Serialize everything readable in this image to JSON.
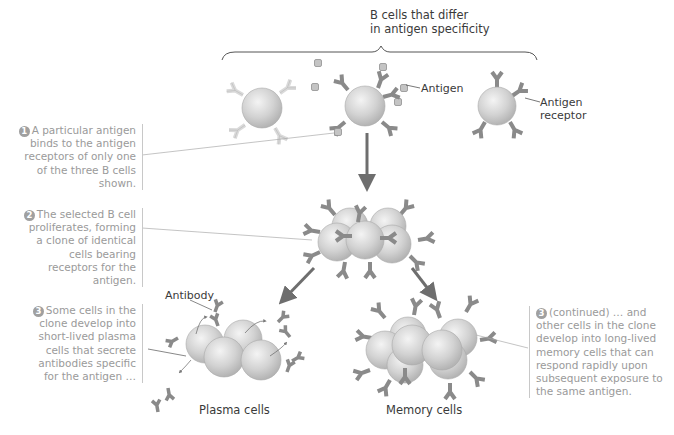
{
  "title": {
    "line1": "B cells that differ",
    "line2": "in antigen specificity"
  },
  "labels": {
    "antigen": "Antigen",
    "antigen_receptor_line1": "Antigen",
    "antigen_receptor_line2": "receptor",
    "antibody": "Antibody",
    "plasma_cells": "Plasma cells",
    "memory_cells": "Memory cells"
  },
  "steps": [
    {
      "number": "1",
      "lines": [
        "A particular antigen",
        "binds to the antigen",
        "receptors of only one",
        "of the three B cells",
        "shown."
      ]
    },
    {
      "number": "2",
      "lines": [
        "The selected B cell",
        "proliferates, forming",
        "a clone of identical",
        "cells bearing",
        "receptors for the",
        "antigen."
      ]
    },
    {
      "number": "3",
      "lines": [
        "Some cells in the",
        "clone develop into",
        "short-lived plasma",
        "cells that secrete",
        "antibodies specific",
        "for the antigen …"
      ]
    },
    {
      "number": "3",
      "lines": [
        "(continued) … and",
        "other cells in the clone",
        "develop into long-lived",
        "memory cells that can",
        "respond rapidly upon",
        "subsequent exposure to",
        "the same antigen."
      ]
    }
  ],
  "colors": {
    "cell": "#d4d4d4",
    "receptor_dark": "#8a8a8a",
    "receptor_light": "#d8d8d8",
    "arrow": "#6e6e6e",
    "note_text": "#9a9a9a",
    "label_text": "#3a3a3a"
  }
}
